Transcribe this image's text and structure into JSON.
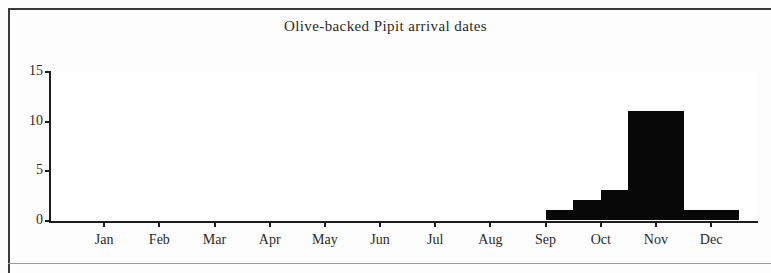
{
  "chart_data": {
    "type": "bar",
    "title": "Olive-backed Pipit arrival dates",
    "xlabel": "",
    "ylabel": "",
    "ylim": [
      0,
      15
    ],
    "yticks": [
      0,
      5,
      10,
      15
    ],
    "ytick_labels": [
      "0",
      "5",
      "10",
      "15"
    ],
    "grid": false,
    "legend": false,
    "categories": [
      "Jan",
      "Feb",
      "Mar",
      "Apr",
      "May",
      "Jun",
      "Jul",
      "Aug",
      "Sep",
      "Oct",
      "Nov",
      "Dec"
    ],
    "bin_description": "half-month bins",
    "bins": [
      {
        "label": "Jan 1",
        "value": 0
      },
      {
        "label": "Jan 2",
        "value": 0
      },
      {
        "label": "Feb 1",
        "value": 0
      },
      {
        "label": "Feb 2",
        "value": 0
      },
      {
        "label": "Mar 1",
        "value": 0
      },
      {
        "label": "Mar 2",
        "value": 0
      },
      {
        "label": "Apr 1",
        "value": 0
      },
      {
        "label": "Apr 2",
        "value": 0
      },
      {
        "label": "May 1",
        "value": 0
      },
      {
        "label": "May 2",
        "value": 0
      },
      {
        "label": "Jun 1",
        "value": 0
      },
      {
        "label": "Jun 2",
        "value": 0
      },
      {
        "label": "Jul 1",
        "value": 0
      },
      {
        "label": "Jul 2",
        "value": 0
      },
      {
        "label": "Aug 1",
        "value": 0
      },
      {
        "label": "Aug 2",
        "value": 0
      },
      {
        "label": "Sep 1",
        "value": 0
      },
      {
        "label": "Sep 2",
        "value": 1
      },
      {
        "label": "Oct 1",
        "value": 2
      },
      {
        "label": "Oct 2",
        "value": 3
      },
      {
        "label": "Oct 3",
        "value": 11
      },
      {
        "label": "Oct 4",
        "value": 11
      },
      {
        "label": "Nov 1",
        "value": 1
      },
      {
        "label": "Nov 2",
        "value": 1
      },
      {
        "label": "Dec 1",
        "value": 0
      },
      {
        "label": "Dec 2",
        "value": 0
      }
    ],
    "values": [
      0,
      0,
      0,
      0,
      0,
      0,
      0,
      0,
      1,
      11,
      1,
      0
    ],
    "axis_color": "#1d1d1d",
    "bar_color": "#080808",
    "background": "#ffffff"
  }
}
